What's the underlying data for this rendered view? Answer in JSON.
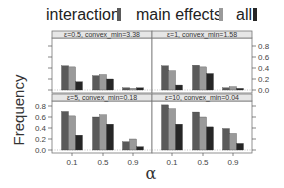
{
  "chart_data": {
    "type": "bar",
    "title": "",
    "xlabel": "α",
    "ylabel": "Frequency",
    "ylim": [
      0,
      0.9
    ],
    "yticks": [
      "0.0",
      "0.2",
      "0.4",
      "0.6",
      "0.8"
    ],
    "categories": [
      "0.1",
      "0.5",
      "0.9"
    ],
    "legend": {
      "placement": "top",
      "entries": [
        {
          "name": "interaction",
          "color": "#5a5a5a"
        },
        {
          "name": "main effects",
          "color": "#9a9a9a"
        },
        {
          "name": "all",
          "color": "#262626"
        }
      ]
    },
    "panels": [
      {
        "label": "ε=0.5, convex_min=3.38",
        "series": [
          {
            "name": "interaction",
            "values": [
              0.44,
              0.26,
              0.04
            ]
          },
          {
            "name": "main effects",
            "values": [
              0.42,
              0.28,
              0.03
            ]
          },
          {
            "name": "all",
            "values": [
              0.15,
              0.2,
              0.04
            ]
          }
        ]
      },
      {
        "label": "ε=1, convex_min=1.58",
        "series": [
          {
            "name": "interaction",
            "values": [
              0.44,
              0.45,
              0.04
            ]
          },
          {
            "name": "main effects",
            "values": [
              0.35,
              0.42,
              0.06
            ]
          },
          {
            "name": "all",
            "values": [
              0.09,
              0.3,
              0.03
            ]
          }
        ]
      },
      {
        "label": "ε=5, convex_min=0.18",
        "series": [
          {
            "name": "interaction",
            "values": [
              0.7,
              0.6,
              0.15
            ]
          },
          {
            "name": "main effects",
            "values": [
              0.62,
              0.64,
              0.2
            ]
          },
          {
            "name": "all",
            "values": [
              0.27,
              0.47,
              0.06
            ]
          }
        ]
      },
      {
        "label": "ε=10, convex_min=0.04",
        "series": [
          {
            "name": "interaction",
            "values": [
              0.82,
              0.69,
              0.39
            ]
          },
          {
            "name": "main effects",
            "values": [
              0.75,
              0.6,
              0.3
            ]
          },
          {
            "name": "all",
            "values": [
              0.47,
              0.42,
              0.12
            ]
          }
        ]
      }
    ]
  }
}
